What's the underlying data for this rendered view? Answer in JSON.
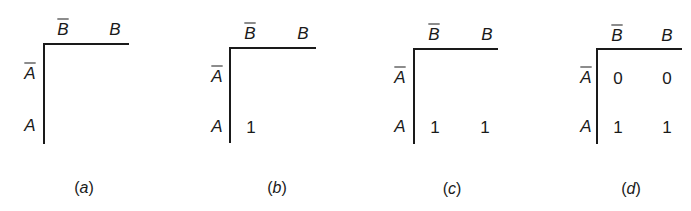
{
  "panels": [
    {
      "id": "a",
      "caption_open": "(",
      "caption_letter": "a",
      "caption_close": ")",
      "col_headers": [
        "B",
        "B"
      ],
      "col_header_negated": [
        true,
        false
      ],
      "row_headers": [
        "A",
        "A"
      ],
      "row_header_negated": [
        true,
        false
      ],
      "cells": [
        [
          "",
          ""
        ],
        [
          "",
          ""
        ]
      ]
    },
    {
      "id": "b",
      "caption_open": "(",
      "caption_letter": "b",
      "caption_close": ")",
      "col_headers": [
        "B",
        "B"
      ],
      "col_header_negated": [
        true,
        false
      ],
      "row_headers": [
        "A",
        "A"
      ],
      "row_header_negated": [
        true,
        false
      ],
      "cells": [
        [
          "",
          ""
        ],
        [
          "1",
          ""
        ]
      ]
    },
    {
      "id": "c",
      "caption_open": "(",
      "caption_letter": "c",
      "caption_close": ")",
      "col_headers": [
        "B",
        "B"
      ],
      "col_header_negated": [
        true,
        false
      ],
      "row_headers": [
        "A",
        "A"
      ],
      "row_header_negated": [
        true,
        false
      ],
      "cells": [
        [
          "",
          ""
        ],
        [
          "1",
          "1"
        ]
      ]
    },
    {
      "id": "d",
      "caption_open": "(",
      "caption_letter": "d",
      "caption_close": ")",
      "col_headers": [
        "B",
        "B"
      ],
      "col_header_negated": [
        true,
        false
      ],
      "row_headers": [
        "A",
        "A"
      ],
      "row_header_negated": [
        true,
        false
      ],
      "cells": [
        [
          "0",
          "0"
        ],
        [
          "1",
          "1"
        ]
      ]
    }
  ]
}
